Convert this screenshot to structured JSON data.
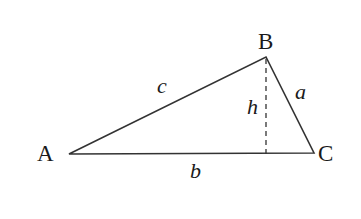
{
  "diagram": {
    "type": "triangle-with-altitude",
    "stroke_color": "#333333",
    "background": "#ffffff",
    "vertices": {
      "A": {
        "label": "A",
        "x": 69,
        "y": 154
      },
      "B": {
        "label": "B",
        "x": 266,
        "y": 57
      },
      "C": {
        "label": "C",
        "x": 314,
        "y": 153
      }
    },
    "altitude_foot": {
      "x": 266,
      "y": 154
    },
    "sides": {
      "a": {
        "label": "a",
        "between": "B-C"
      },
      "b": {
        "label": "b",
        "between": "A-C"
      },
      "c": {
        "label": "c",
        "between": "A-B"
      }
    },
    "altitude": {
      "label": "h",
      "style": "dashed",
      "from": "B"
    }
  }
}
